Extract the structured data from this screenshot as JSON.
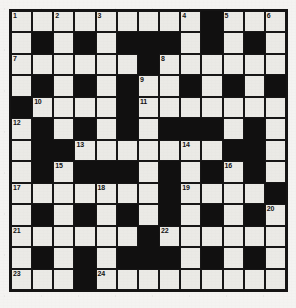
{
  "puzzle": {
    "title": "Crossword Grid",
    "type": "crossword",
    "columns": 13,
    "rows": 13,
    "colors": {
      "white_cell": "#ebeae6",
      "black_cell": "#111010",
      "grid_line": "#171616",
      "page_background": "#f4f3f1",
      "number_text": "#131212"
    },
    "legend": {
      "white": "open letter square",
      "black": "blocked square"
    },
    "clue_numbers": [
      1,
      2,
      3,
      4,
      5,
      6,
      7,
      8,
      9,
      10,
      11,
      12,
      13,
      14,
      15,
      16,
      17,
      18,
      19,
      20,
      21,
      22,
      23,
      24
    ],
    "grid": [
      [
        "W1",
        "W",
        "W2",
        "W",
        "W3",
        "W",
        "W",
        "W",
        "W4",
        "B",
        "W5",
        "W",
        "W6"
      ],
      [
        "W",
        "B",
        "W",
        "B",
        "W",
        "B",
        "B",
        "B",
        "W",
        "B",
        "W",
        "B",
        "W"
      ],
      [
        "W7",
        "W",
        "W",
        "W",
        "W",
        "W",
        "B",
        "W8",
        "W",
        "W",
        "W",
        "W",
        "W"
      ],
      [
        "W",
        "B",
        "W",
        "B",
        "W",
        "B",
        "W9",
        "W",
        "B",
        "W",
        "B",
        "W",
        "B"
      ],
      [
        "B",
        "W10",
        "W",
        "W",
        "W",
        "B",
        "W11",
        "W",
        "W",
        "W",
        "W",
        "W",
        "W"
      ],
      [
        "W12",
        "B",
        "W",
        "B",
        "W",
        "B",
        "W",
        "B",
        "B",
        "B",
        "W",
        "B",
        "W"
      ],
      [
        "W",
        "B",
        "B",
        "W13",
        "W",
        "W",
        "W",
        "W",
        "W14",
        "W",
        "B",
        "B",
        "W"
      ],
      [
        "W",
        "B",
        "W15",
        "B",
        "B",
        "B",
        "W",
        "B",
        "W",
        "B",
        "W16",
        "B",
        "W"
      ],
      [
        "W17",
        "W",
        "W",
        "W",
        "W18",
        "W",
        "W",
        "B",
        "W19",
        "W",
        "W",
        "W",
        "B"
      ],
      [
        "W",
        "B",
        "W",
        "B",
        "W",
        "B",
        "W",
        "B",
        "W",
        "B",
        "W",
        "B",
        "W20"
      ],
      [
        "W21",
        "W",
        "W",
        "W",
        "W",
        "W",
        "B",
        "W22",
        "W",
        "W",
        "W",
        "W",
        "W"
      ],
      [
        "W",
        "B",
        "W",
        "B",
        "W",
        "B",
        "B",
        "B",
        "W",
        "B",
        "W",
        "B",
        "W"
      ],
      [
        "W23",
        "W",
        "W",
        "B",
        "W24",
        "W",
        "W",
        "W",
        "W",
        "W",
        "W",
        "W",
        "W"
      ]
    ]
  }
}
